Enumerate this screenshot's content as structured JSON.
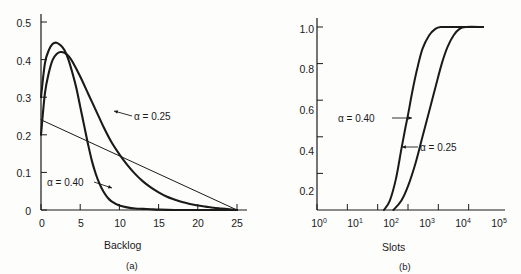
{
  "figure": {
    "background_color": "#fdfdfc",
    "ink_color": "#1a1a1a"
  },
  "panel_a": {
    "caption": "(a)",
    "xlabel": "Backlog",
    "ylabel": "",
    "x_ticks": [
      "0",
      "5",
      "10",
      "15",
      "20",
      "25"
    ],
    "y_ticks": [
      "0",
      "0.1",
      "0.2",
      "0.3",
      "0.4",
      "0.5"
    ],
    "annotations": [
      {
        "name": "alpha-025-label",
        "text": "α = 0.25"
      },
      {
        "name": "alpha-040-label",
        "text": "α = 0.40"
      }
    ]
  },
  "panel_b": {
    "caption": "(b)",
    "xlabel": "Slots",
    "ylabel": "Probability of unstable state",
    "x_ticks": [
      {
        "mantissa": "10",
        "exponent": "0"
      },
      {
        "mantissa": "10",
        "exponent": "1"
      },
      {
        "mantissa": "10",
        "exponent": "2"
      },
      {
        "mantissa": "10",
        "exponent": "3"
      },
      {
        "mantissa": "10",
        "exponent": "4"
      },
      {
        "mantissa": "10",
        "exponent": "5"
      }
    ],
    "y_ticks": [
      "0.2",
      "0.4",
      "0.6",
      "0.8",
      "1.0"
    ],
    "annotations": [
      {
        "name": "alpha-040-label",
        "text": "α = 0.40"
      },
      {
        "name": "alpha-025-label",
        "text": "α = 0.25"
      }
    ]
  },
  "chart_data": [
    {
      "type": "line",
      "panel": "(a)",
      "title": "",
      "xlabel": "Backlog",
      "ylabel": "",
      "xlim": [
        0,
        25
      ],
      "ylim": [
        0,
        0.5
      ],
      "xticks": [
        0,
        5,
        10,
        15,
        20,
        25
      ],
      "yticks": [
        0,
        0.1,
        0.2,
        0.3,
        0.4,
        0.5
      ],
      "grid": false,
      "legend_position": "inline-annotations",
      "series": [
        {
          "name": "α = 0.40",
          "annotation": "α = 0.40",
          "x": [
            0,
            0.5,
            1,
            1.5,
            2,
            2.5,
            3,
            3.5,
            4,
            4.5,
            5,
            5.5,
            6,
            6.5,
            7,
            7.5,
            8,
            8.5,
            9,
            10,
            11,
            12,
            13,
            14,
            15,
            17,
            20,
            25
          ],
          "y": [
            0.3,
            0.39,
            0.425,
            0.442,
            0.445,
            0.438,
            0.425,
            0.4,
            0.365,
            0.325,
            0.275,
            0.225,
            0.175,
            0.13,
            0.095,
            0.068,
            0.048,
            0.033,
            0.023,
            0.012,
            0.007,
            0.004,
            0.003,
            0.002,
            0.001,
            0.0,
            0.0,
            0.0
          ]
        },
        {
          "name": "α = 0.25",
          "annotation": "α = 0.25",
          "x": [
            0,
            0.5,
            1,
            1.5,
            2,
            2.5,
            3,
            3.5,
            4,
            5,
            6,
            7,
            8,
            9,
            10,
            11,
            12,
            13,
            14,
            15,
            16,
            17,
            18,
            19,
            20,
            21,
            22,
            23,
            24,
            25
          ],
          "y": [
            0.2,
            0.31,
            0.365,
            0.4,
            0.415,
            0.42,
            0.418,
            0.41,
            0.395,
            0.355,
            0.31,
            0.265,
            0.22,
            0.18,
            0.148,
            0.12,
            0.096,
            0.076,
            0.06,
            0.047,
            0.036,
            0.028,
            0.021,
            0.016,
            0.012,
            0.009,
            0.006,
            0.004,
            0.002,
            0.0
          ]
        },
        {
          "name": "departure-line",
          "annotation": "",
          "x": [
            0,
            25
          ],
          "y": [
            0.24,
            0.0
          ]
        }
      ]
    },
    {
      "type": "line",
      "panel": "(b)",
      "title": "",
      "xlabel": "Slots",
      "ylabel": "Probability of unstable state",
      "xscale": "log",
      "xlim": [
        1,
        1000000
      ],
      "ylim": [
        0,
        1.0
      ],
      "xticks": [
        1,
        10,
        100,
        1000,
        10000,
        100000
      ],
      "yticks": [
        0.2,
        0.4,
        0.6,
        0.8,
        1.0
      ],
      "grid": false,
      "legend_position": "inline-annotations",
      "series": [
        {
          "name": "α = 0.40",
          "annotation": "α = 0.40",
          "x": [
            160,
            250,
            400,
            600,
            800,
            1000,
            1400,
            2000,
            3000,
            5000,
            8000,
            12000,
            30000,
            300000
          ],
          "y": [
            0.0,
            0.05,
            0.17,
            0.33,
            0.44,
            0.52,
            0.65,
            0.77,
            0.88,
            0.955,
            0.99,
            1.0,
            1.0,
            1.0
          ]
        },
        {
          "name": "α = 0.25",
          "annotation": "α = 0.25",
          "x": [
            330,
            600,
            1000,
            1800,
            3000,
            5000,
            8000,
            13000,
            20000,
            32000,
            50000,
            80000,
            300000
          ],
          "y": [
            0.0,
            0.05,
            0.13,
            0.26,
            0.4,
            0.54,
            0.67,
            0.8,
            0.89,
            0.955,
            0.99,
            1.0,
            1.0
          ]
        }
      ]
    }
  ]
}
